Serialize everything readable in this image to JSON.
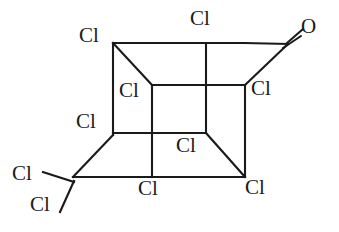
{
  "figure": {
    "kind": "chemical-structure-diagram",
    "width": 339,
    "height": 232,
    "background_color": "#ffffff",
    "bond_color": "#1a1a1a",
    "label_color": "#1a1a1a"
  },
  "atom_labels": [
    {
      "id": "cl-top-left",
      "text": "Cl",
      "x": 79,
      "y": 25
    },
    {
      "id": "cl-top-middle",
      "text": "Cl",
      "x": 190,
      "y": 8
    },
    {
      "id": "o-carbonyl",
      "text": "O",
      "x": 301,
      "y": 16
    },
    {
      "id": "cl-inner-upper",
      "text": "Cl",
      "x": 119,
      "y": 80
    },
    {
      "id": "cl-right-middle",
      "text": "Cl",
      "x": 251,
      "y": 78
    },
    {
      "id": "cl-left-middle",
      "text": "Cl",
      "x": 76,
      "y": 111
    },
    {
      "id": "cl-inner-lower",
      "text": "Cl",
      "x": 176,
      "y": 135
    },
    {
      "id": "cl-lower-left-a",
      "text": "Cl",
      "x": 12,
      "y": 163
    },
    {
      "id": "cl-lower-left-b",
      "text": "Cl",
      "x": 30,
      "y": 194
    },
    {
      "id": "cl-bottom-middle",
      "text": "Cl",
      "x": 138,
      "y": 178
    },
    {
      "id": "cl-bottom-right",
      "text": "Cl",
      "x": 245,
      "y": 177
    }
  ],
  "bonds": [
    {
      "id": "back-top-edge",
      "type": "single",
      "x1": 113,
      "y1": 43,
      "x2": 245,
      "y2": 43
    },
    {
      "id": "back-left-edge",
      "type": "single",
      "x1": 113,
      "y1": 43,
      "x2": 113,
      "y2": 135
    },
    {
      "id": "back-right-edge",
      "type": "single",
      "x1": 245,
      "y1": 85,
      "x2": 245,
      "y2": 177
    },
    {
      "id": "bottom-long-edge",
      "type": "single",
      "x1": 73,
      "y1": 177,
      "x2": 245,
      "y2": 177
    },
    {
      "id": "front-top-edge",
      "type": "single",
      "x1": 152,
      "y1": 85,
      "x2": 245,
      "y2": 85
    },
    {
      "id": "front-left-edge",
      "type": "single",
      "x1": 152,
      "y1": 85,
      "x2": 152,
      "y2": 177
    },
    {
      "id": "front-bottom-edge",
      "type": "single",
      "x1": 113,
      "y1": 133,
      "x2": 206,
      "y2": 133
    },
    {
      "id": "front-vertical-mid",
      "type": "single",
      "x1": 206,
      "y1": 43,
      "x2": 206,
      "y2": 133
    },
    {
      "id": "left-mid-edge",
      "type": "single",
      "x1": 113,
      "y1": 133,
      "x2": 152,
      "y2": 133
    },
    {
      "id": "diagonal-top-left",
      "type": "single",
      "x1": 113,
      "y1": 43,
      "x2": 152,
      "y2": 85
    },
    {
      "id": "diagonal-bottom-left",
      "type": "single",
      "x1": 113,
      "y1": 135,
      "x2": 73,
      "y2": 177
    },
    {
      "id": "diagonal-bottom-right",
      "type": "single",
      "x1": 206,
      "y1": 133,
      "x2": 245,
      "y2": 177
    },
    {
      "id": "carbonyl-upper-arm",
      "type": "single",
      "x1": 245,
      "y1": 43,
      "x2": 288,
      "y2": 44
    },
    {
      "id": "carbonyl-lower-arm",
      "type": "single",
      "x1": 245,
      "y1": 85,
      "x2": 288,
      "y2": 44
    },
    {
      "id": "ccl2-bond-left",
      "type": "single",
      "x1": 73,
      "y1": 182,
      "x2": 43,
      "y2": 172
    },
    {
      "id": "ccl2-bond-lower",
      "type": "single",
      "x1": 73,
      "y1": 182,
      "x2": 60,
      "y2": 211
    }
  ],
  "double_bond": {
    "id": "carbonyl-double-bond",
    "label": "C=O",
    "line_a": {
      "x1": 287,
      "y1": 43,
      "x2": 303,
      "y2": 29
    },
    "line_b": {
      "x1": 283,
      "y1": 48,
      "x2": 301,
      "y2": 35
    }
  },
  "counts": {
    "chlorine_atoms": 10,
    "oxygen_atoms": 1
  }
}
